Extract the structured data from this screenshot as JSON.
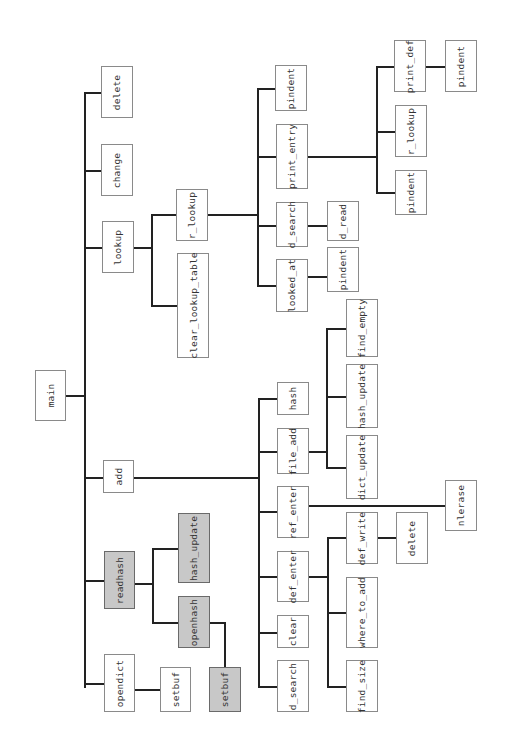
{
  "diagram": {
    "title": "",
    "orientation": "rotated-90",
    "colors": {
      "highlight_fill": "#c8c8c8",
      "box_border": "#8a8a8a",
      "edge": "#222222",
      "background": "#ffffff"
    },
    "nodes": [
      {
        "id": "main",
        "label": "main",
        "highlight": false,
        "x": 35,
        "y": 370,
        "w": 31,
        "h": 51
      },
      {
        "id": "delete",
        "label": "delete",
        "highlight": false,
        "x": 101,
        "y": 66,
        "w": 32,
        "h": 52
      },
      {
        "id": "change",
        "label": "change",
        "highlight": false,
        "x": 101,
        "y": 144,
        "w": 32,
        "h": 52
      },
      {
        "id": "lookup",
        "label": "lookup",
        "highlight": false,
        "x": 102,
        "y": 221,
        "w": 32,
        "h": 52
      },
      {
        "id": "add",
        "label": "add",
        "highlight": false,
        "x": 103,
        "y": 460,
        "w": 31,
        "h": 33
      },
      {
        "id": "readhash",
        "label": "readhash",
        "highlight": true,
        "x": 104,
        "y": 551,
        "w": 31,
        "h": 58
      },
      {
        "id": "opendict",
        "label": "opendict",
        "highlight": false,
        "x": 104,
        "y": 654,
        "w": 31,
        "h": 58
      },
      {
        "id": "r_lookup_1",
        "label": "r_lookup",
        "highlight": false,
        "x": 176,
        "y": 189,
        "w": 32,
        "h": 52
      },
      {
        "id": "clear_lookup_table",
        "label": "clear_lookup_table",
        "highlight": false,
        "x": 177,
        "y": 253,
        "w": 32,
        "h": 105
      },
      {
        "id": "hash_update_1",
        "label": "hash_update",
        "highlight": true,
        "x": 178,
        "y": 513,
        "w": 32,
        "h": 70
      },
      {
        "id": "openhash",
        "label": "openhash",
        "highlight": true,
        "x": 178,
        "y": 596,
        "w": 32,
        "h": 52
      },
      {
        "id": "setbuf_1",
        "label": "setbuf",
        "highlight": false,
        "x": 160,
        "y": 667,
        "w": 31,
        "h": 45
      },
      {
        "id": "setbuf_2",
        "label": "setbuf",
        "highlight": true,
        "x": 209,
        "y": 667,
        "w": 32,
        "h": 45
      },
      {
        "id": "pindent_1",
        "label": "pindent",
        "highlight": false,
        "x": 275,
        "y": 65,
        "w": 32,
        "h": 46
      },
      {
        "id": "print_entry",
        "label": "print_entry",
        "highlight": false,
        "x": 276,
        "y": 124,
        "w": 32,
        "h": 65
      },
      {
        "id": "d_search_1",
        "label": "d_search",
        "highlight": false,
        "x": 276,
        "y": 202,
        "w": 32,
        "h": 45
      },
      {
        "id": "looked_at",
        "label": "looked_at",
        "highlight": false,
        "x": 276,
        "y": 259,
        "w": 32,
        "h": 53
      },
      {
        "id": "hash",
        "label": "hash",
        "highlight": false,
        "x": 277,
        "y": 382,
        "w": 32,
        "h": 33
      },
      {
        "id": "file_add",
        "label": "file_add",
        "highlight": false,
        "x": 277,
        "y": 428,
        "w": 32,
        "h": 46
      },
      {
        "id": "ref_enter",
        "label": "ref_enter",
        "highlight": false,
        "x": 277,
        "y": 486,
        "w": 32,
        "h": 52
      },
      {
        "id": "def_enter",
        "label": "def_enter",
        "highlight": false,
        "x": 277,
        "y": 551,
        "w": 32,
        "h": 51
      },
      {
        "id": "clear",
        "label": "clear",
        "highlight": false,
        "x": 277,
        "y": 615,
        "w": 32,
        "h": 33
      },
      {
        "id": "d_search_2",
        "label": "d_search",
        "highlight": false,
        "x": 277,
        "y": 660,
        "w": 32,
        "h": 52
      },
      {
        "id": "d_read",
        "label": "d_read",
        "highlight": false,
        "x": 327,
        "y": 201,
        "w": 32,
        "h": 40
      },
      {
        "id": "pindent_2",
        "label": "pindent",
        "highlight": false,
        "x": 327,
        "y": 247,
        "w": 32,
        "h": 45
      },
      {
        "id": "find_empty",
        "label": "find_empty",
        "highlight": false,
        "x": 346,
        "y": 299,
        "w": 32,
        "h": 58
      },
      {
        "id": "hash_update_2",
        "label": "hash_update",
        "highlight": false,
        "x": 346,
        "y": 364,
        "w": 32,
        "h": 64
      },
      {
        "id": "dict_update",
        "label": "dict_update",
        "highlight": false,
        "x": 346,
        "y": 435,
        "w": 32,
        "h": 64
      },
      {
        "id": "def_write",
        "label": "def_write",
        "highlight": false,
        "x": 346,
        "y": 512,
        "w": 32,
        "h": 52
      },
      {
        "id": "where_to_add",
        "label": "where_to_add",
        "highlight": false,
        "x": 346,
        "y": 577,
        "w": 32,
        "h": 71
      },
      {
        "id": "find_size",
        "label": "find_size",
        "highlight": false,
        "x": 346,
        "y": 660,
        "w": 32,
        "h": 52
      },
      {
        "id": "delete_2",
        "label": "delete",
        "highlight": false,
        "x": 396,
        "y": 512,
        "w": 32,
        "h": 52
      },
      {
        "id": "print_def",
        "label": "print_def",
        "highlight": false,
        "x": 394,
        "y": 40,
        "w": 32,
        "h": 52
      },
      {
        "id": "r_lookup_2",
        "label": "r_lookup",
        "highlight": false,
        "x": 395,
        "y": 105,
        "w": 32,
        "h": 52
      },
      {
        "id": "pindent_3",
        "label": "pindent",
        "highlight": false,
        "x": 395,
        "y": 170,
        "w": 32,
        "h": 45
      },
      {
        "id": "pindent_4",
        "label": "pindent",
        "highlight": false,
        "x": 445,
        "y": 40,
        "w": 32,
        "h": 52
      },
      {
        "id": "nlerase",
        "label": "nlerase",
        "highlight": false,
        "x": 445,
        "y": 480,
        "w": 32,
        "h": 51
      }
    ],
    "edges_segments": [
      {
        "dir": "v",
        "x": 84,
        "y": 92,
        "len": 218
      },
      {
        "dir": "v",
        "x": 84,
        "y": 300,
        "len": 388
      },
      {
        "dir": "h",
        "x": 66,
        "y": 395,
        "len": 19
      },
      {
        "dir": "h",
        "x": 84,
        "y": 92,
        "len": 18
      },
      {
        "dir": "h",
        "x": 84,
        "y": 170,
        "len": 18
      },
      {
        "dir": "h",
        "x": 84,
        "y": 247,
        "len": 19
      },
      {
        "dir": "h",
        "x": 84,
        "y": 477,
        "len": 20
      },
      {
        "dir": "h",
        "x": 84,
        "y": 580,
        "len": 21
      },
      {
        "dir": "h",
        "x": 84,
        "y": 683,
        "len": 21
      },
      {
        "dir": "h",
        "x": 133,
        "y": 247,
        "len": 19
      },
      {
        "dir": "v",
        "x": 151,
        "y": 214,
        "len": 92
      },
      {
        "dir": "h",
        "x": 151,
        "y": 214,
        "len": 26
      },
      {
        "dir": "h",
        "x": 151,
        "y": 305,
        "len": 27
      },
      {
        "dir": "h",
        "x": 207,
        "y": 214,
        "len": 52
      },
      {
        "dir": "v",
        "x": 257,
        "y": 88,
        "len": 199
      },
      {
        "dir": "h",
        "x": 257,
        "y": 88,
        "len": 19
      },
      {
        "dir": "h",
        "x": 257,
        "y": 156,
        "len": 20
      },
      {
        "dir": "h",
        "x": 257,
        "y": 225,
        "len": 20
      },
      {
        "dir": "h",
        "x": 257,
        "y": 285,
        "len": 20
      },
      {
        "dir": "h",
        "x": 307,
        "y": 156,
        "len": 70
      },
      {
        "dir": "v",
        "x": 376,
        "y": 66,
        "len": 127
      },
      {
        "dir": "h",
        "x": 376,
        "y": 66,
        "len": 19
      },
      {
        "dir": "h",
        "x": 376,
        "y": 131,
        "len": 20
      },
      {
        "dir": "h",
        "x": 376,
        "y": 192,
        "len": 20
      },
      {
        "dir": "h",
        "x": 425,
        "y": 66,
        "len": 21
      },
      {
        "dir": "h",
        "x": 307,
        "y": 225,
        "len": 21
      },
      {
        "dir": "h",
        "x": 307,
        "y": 276,
        "len": 21
      },
      {
        "dir": "h",
        "x": 134,
        "y": 477,
        "len": 125
      },
      {
        "dir": "v",
        "x": 258,
        "y": 398,
        "len": 290
      },
      {
        "dir": "h",
        "x": 258,
        "y": 398,
        "len": 20
      },
      {
        "dir": "h",
        "x": 258,
        "y": 451,
        "len": 20
      },
      {
        "dir": "h",
        "x": 258,
        "y": 511,
        "len": 20
      },
      {
        "dir": "h",
        "x": 258,
        "y": 576,
        "len": 20
      },
      {
        "dir": "h",
        "x": 258,
        "y": 632,
        "len": 20
      },
      {
        "dir": "h",
        "x": 258,
        "y": 686,
        "len": 20
      },
      {
        "dir": "h",
        "x": 308,
        "y": 451,
        "len": 20
      },
      {
        "dir": "v",
        "x": 326,
        "y": 328,
        "len": 140
      },
      {
        "dir": "h",
        "x": 326,
        "y": 328,
        "len": 21
      },
      {
        "dir": "h",
        "x": 326,
        "y": 396,
        "len": 21
      },
      {
        "dir": "h",
        "x": 326,
        "y": 467,
        "len": 21
      },
      {
        "dir": "h",
        "x": 308,
        "y": 505,
        "len": 138
      },
      {
        "dir": "h",
        "x": 308,
        "y": 576,
        "len": 21
      },
      {
        "dir": "v",
        "x": 327,
        "y": 537,
        "len": 151
      },
      {
        "dir": "h",
        "x": 327,
        "y": 537,
        "len": 20
      },
      {
        "dir": "h",
        "x": 327,
        "y": 612,
        "len": 20
      },
      {
        "dir": "h",
        "x": 327,
        "y": 686,
        "len": 20
      },
      {
        "dir": "h",
        "x": 377,
        "y": 537,
        "len": 20
      },
      {
        "dir": "h",
        "x": 134,
        "y": 583,
        "len": 19
      },
      {
        "dir": "v",
        "x": 152,
        "y": 548,
        "len": 76
      },
      {
        "dir": "h",
        "x": 152,
        "y": 548,
        "len": 27
      },
      {
        "dir": "h",
        "x": 152,
        "y": 622,
        "len": 27
      },
      {
        "dir": "h",
        "x": 209,
        "y": 622,
        "len": 17
      },
      {
        "dir": "v",
        "x": 224,
        "y": 622,
        "len": 46
      },
      {
        "dir": "h",
        "x": 134,
        "y": 689,
        "len": 27
      }
    ]
  }
}
